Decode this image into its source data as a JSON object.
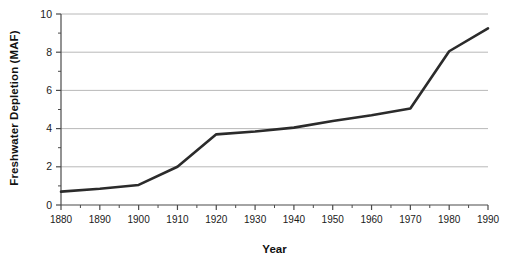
{
  "chart_data": {
    "type": "line",
    "title": "",
    "xlabel": "Year",
    "ylabel": "Freshwater Depletion (MAF)",
    "x": [
      1880,
      1890,
      1900,
      1910,
      1920,
      1930,
      1940,
      1950,
      1960,
      1970,
      1980,
      1990
    ],
    "values": [
      0.7,
      0.85,
      1.05,
      2.0,
      3.7,
      3.85,
      4.05,
      4.4,
      4.7,
      5.05,
      8.05,
      9.25
    ],
    "series": [
      {
        "name": "Freshwater Depletion",
        "values": [
          0.7,
          0.85,
          1.05,
          2.0,
          3.7,
          3.85,
          4.05,
          4.4,
          4.7,
          5.05,
          8.05,
          9.25
        ]
      }
    ],
    "xlim": [
      1880,
      1990
    ],
    "ylim": [
      0,
      10
    ],
    "xticks": [
      1880,
      1890,
      1900,
      1910,
      1920,
      1930,
      1940,
      1950,
      1960,
      1970,
      1980,
      1990
    ],
    "xtick_labels": [
      "1880",
      "1890",
      "1900",
      "1910",
      "1920",
      "1930",
      "1940",
      "1950",
      "1960",
      "1970",
      "1980",
      "1990"
    ],
    "x_minor_tick_interval": 5,
    "yticks": [
      0,
      2,
      4,
      6,
      8,
      10
    ],
    "ytick_labels": [
      "0",
      "2",
      "4",
      "6",
      "8",
      "10"
    ],
    "y_minor_ticks": [
      1,
      3,
      5,
      7,
      9
    ],
    "grid": "horizontal",
    "legend": "none",
    "line_color": "#2b2b2b",
    "grid_color": "#b0b0b0",
    "axis_color": "#4a4a4a"
  }
}
